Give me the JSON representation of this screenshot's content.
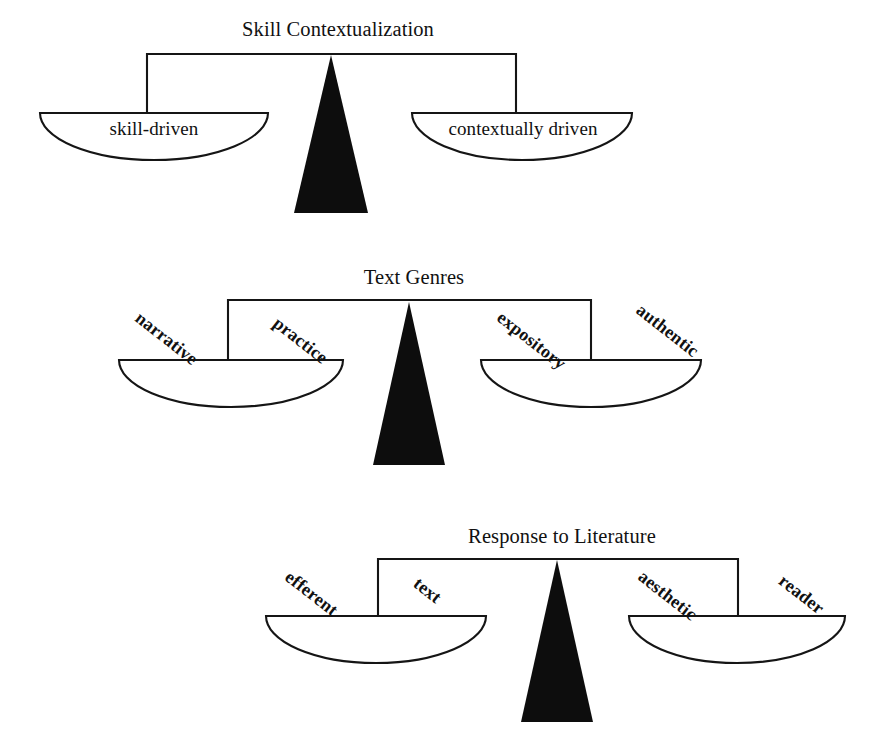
{
  "document": {
    "kind": "balance-scale-diagram",
    "background_color": "#ffffff",
    "ink_color": "#111111",
    "fulcrum_color": "#0d0d0d"
  },
  "scales": [
    {
      "id": "skill-contextualization",
      "title": "Skill Contextualization",
      "label_style": "horizontal",
      "left_pan": {
        "labels": [
          "skill-driven"
        ]
      },
      "right_pan": {
        "labels": [
          "contextually driven"
        ]
      }
    },
    {
      "id": "text-genres",
      "title": "Text Genres",
      "label_style": "rotated",
      "left_pan": {
        "labels": [
          "narrative",
          "practice"
        ]
      },
      "right_pan": {
        "labels": [
          "expository",
          "authentic"
        ]
      }
    },
    {
      "id": "response-to-literature",
      "title": "Response to Literature",
      "label_style": "rotated",
      "left_pan": {
        "labels": [
          "efferent",
          "text"
        ]
      },
      "right_pan": {
        "labels": [
          "aesthetic",
          "reader"
        ]
      }
    }
  ],
  "geometry": {
    "scale1": {
      "title_x": 338,
      "title_y": 36,
      "beam_y": 54,
      "beam_left_x": 147,
      "beam_right_x": 516,
      "left_pan_cx": 154,
      "left_pan_top": 113,
      "left_pan_rx": 114,
      "left_pan_ry": 47,
      "right_pan_cx": 522,
      "right_pan_top": 113,
      "right_pan_rx": 110,
      "right_pan_ry": 47,
      "tri_apex_x": 331,
      "tri_apex_y": 55,
      "tri_half_w": 37,
      "tri_base_y": 213
    },
    "scale2": {
      "title_x": 414,
      "title_y": 284,
      "beam_y": 300,
      "beam_left_x": 228,
      "beam_right_x": 591,
      "left_pan_cx": 231,
      "left_pan_top": 360,
      "left_pan_rx": 112,
      "left_pan_ry": 47,
      "right_pan_cx": 591,
      "right_pan_top": 360,
      "right_pan_rx": 110,
      "right_pan_ry": 47,
      "tri_apex_x": 409,
      "tri_apex_y": 302,
      "tri_half_w": 36,
      "tri_base_y": 465
    },
    "scale3": {
      "title_x": 562,
      "title_y": 543,
      "beam_y": 559,
      "beam_left_x": 378,
      "beam_right_x": 738,
      "left_pan_cx": 376,
      "left_pan_top": 616,
      "left_pan_rx": 110,
      "left_pan_ry": 47,
      "right_pan_cx": 737,
      "right_pan_top": 616,
      "right_pan_rx": 108,
      "right_pan_ry": 47,
      "tri_apex_x": 557,
      "tri_apex_y": 560,
      "tri_half_w": 36,
      "tri_base_y": 722
    }
  }
}
